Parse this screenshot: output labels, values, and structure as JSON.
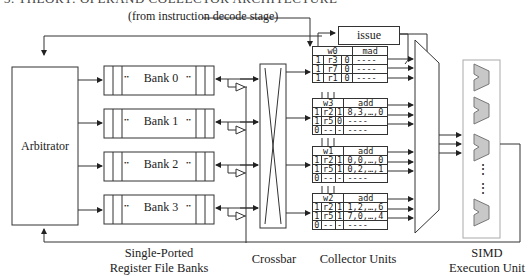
{
  "heading_fragment": "3. THEORY: OPERAND COLLECTOR ARCHITECTURE",
  "source_label": "(from instruction decode stage)",
  "arbitrator": {
    "label": "Arbitrator"
  },
  "banks": [
    {
      "label": "Bank 0"
    },
    {
      "label": "Bank 1"
    },
    {
      "label": "Bank 2"
    },
    {
      "label": "Bank 3"
    }
  ],
  "bank_dots": "••",
  "issue": {
    "label": "issue"
  },
  "collector_units": [
    {
      "warp": "w0",
      "op": "mad",
      "rows": [
        {
          "v": "1",
          "reg": "r3",
          "r": "0",
          "data": "----"
        },
        {
          "v": "1",
          "reg": "r7",
          "r": "0",
          "data": "----"
        },
        {
          "v": "1",
          "reg": "r1",
          "r": "0",
          "data": "----"
        }
      ]
    },
    {
      "warp": "w3",
      "op": "add",
      "rows": [
        {
          "v": "1",
          "reg": "r2",
          "r": "1",
          "data": "8,3,…,0"
        },
        {
          "v": "1",
          "reg": "r5",
          "r": "0",
          "data": "----"
        },
        {
          "v": "0",
          "reg": "--",
          "r": "-",
          "data": "----"
        }
      ]
    },
    {
      "warp": "w1",
      "op": "add",
      "rows": [
        {
          "v": "1",
          "reg": "r2",
          "r": "1",
          "data": "0,0,…,0"
        },
        {
          "v": "1",
          "reg": "r5",
          "r": "1",
          "data": "0,2,…,1"
        },
        {
          "v": "0",
          "reg": "--",
          "r": "-",
          "data": "----"
        }
      ]
    },
    {
      "warp": "w2",
      "op": "add",
      "rows": [
        {
          "v": "1",
          "reg": "r2",
          "r": "1",
          "data": "1,2,…,6"
        },
        {
          "v": "1",
          "reg": "r5",
          "r": "1",
          "data": "7,0,…,4"
        },
        {
          "v": "0",
          "reg": "--",
          "r": "-",
          "data": "----"
        }
      ]
    }
  ],
  "captions": {
    "banks": [
      "Single-Ported",
      "Register File Banks"
    ],
    "crossbar": "Crossbar",
    "collectors": "Collector Units",
    "simd": [
      "SIMD",
      "Execution Unit"
    ]
  },
  "simd_dots": "⋮",
  "colors": {
    "stroke": "#333333",
    "alu_fill": "#c8c8c8",
    "alu_stroke": "#777777",
    "simd_border": "#aaaaaa"
  }
}
